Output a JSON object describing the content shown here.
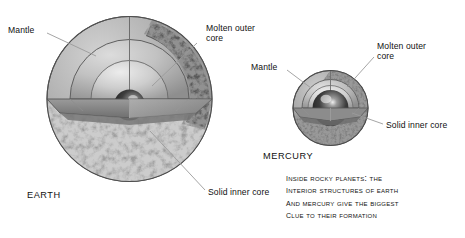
{
  "figure": {
    "background_color": "#ffffff",
    "line_color": "#8c8c8c",
    "text_color": "#111111",
    "caption_lines": [
      "Inside rocky planets: the",
      "interior structures of Earth",
      "and Mercury give the biggest",
      "clue to their formation"
    ]
  },
  "earth": {
    "name_label": "EARTH",
    "labels": {
      "mantle": "Mantle",
      "molten_outer_core_line1": "Molten outer",
      "molten_outer_core_line2": "core",
      "solid_inner_core": "Solid inner core"
    },
    "layers": [
      {
        "name": "crust-surface",
        "color": "#9a9a9a"
      },
      {
        "name": "mantle",
        "color": "#a8a8a8"
      },
      {
        "name": "molten-outer-core",
        "color": "#c4c4c4"
      },
      {
        "name": "solid-inner-core",
        "color": "#3a3a3a"
      }
    ]
  },
  "mercury": {
    "name_label": "MERCURY",
    "labels": {
      "mantle": "Mantle",
      "molten_outer_core_line1": "Molten outer",
      "molten_outer_core_line2": "core",
      "solid_inner_core": "Solid inner core"
    },
    "layers": [
      {
        "name": "crust-surface",
        "color": "#8f8f8f"
      },
      {
        "name": "mantle",
        "color": "#b0b0b0"
      },
      {
        "name": "molten-outer-core",
        "color": "#c8c8c8"
      },
      {
        "name": "solid-inner-core",
        "color": "#333333"
      }
    ]
  }
}
